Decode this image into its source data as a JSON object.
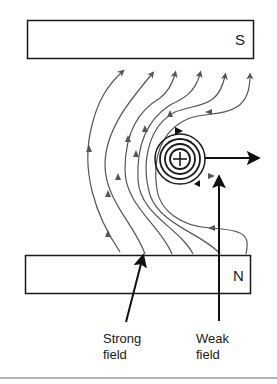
{
  "diagram": {
    "title": "",
    "magnets": {
      "top": {
        "pole": "S"
      },
      "bottom": {
        "pole": "N"
      }
    },
    "wire": {
      "symbol": "plus-current-into-page"
    },
    "labels": {
      "strong_line1": "Strong",
      "strong_line2": "field",
      "weak_line1": "Weak",
      "weak_line2": "field"
    },
    "colors": {
      "field_lines": "#555555",
      "outline": "#1a1a1a",
      "footer_rule": "#999999"
    }
  }
}
